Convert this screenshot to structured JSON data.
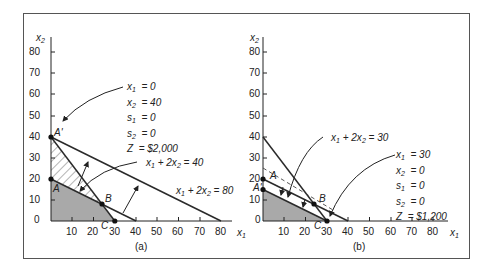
{
  "figure": {
    "panels": [
      {
        "label": "(a)",
        "x_axis_label": "x1",
        "y_axis_label": "x2",
        "x_ticks": [
          "10",
          "20",
          "30",
          "40",
          "50",
          "60",
          "70",
          "80"
        ],
        "y_ticks": [
          "0",
          "10",
          "20",
          "30",
          "40",
          "50",
          "60",
          "70",
          "80"
        ],
        "points": [
          {
            "name": "A'",
            "x": 0,
            "y": 40
          },
          {
            "name": "A",
            "x": 0,
            "y": 20
          },
          {
            "name": "B",
            "x": 24,
            "y": 8
          },
          {
            "name": "C",
            "x": 30,
            "y": 0
          }
        ],
        "line_labels": [
          "x1 + 2x2 = 40",
          "x1 + 2x2 = 80"
        ],
        "callout": {
          "lines": [
            "x1 = 0",
            "x2 = 40",
            "s1 = 0",
            "s2 = 0",
            "Z = $2,000"
          ]
        }
      },
      {
        "label": "(b)",
        "x_axis_label": "x1",
        "y_axis_label": "x2",
        "x_ticks": [
          "10",
          "20",
          "30",
          "40",
          "50",
          "60",
          "70",
          "80"
        ],
        "y_ticks": [
          "0",
          "10",
          "20",
          "30",
          "40",
          "50",
          "60",
          "70",
          "80"
        ],
        "points": [
          {
            "name": "A",
            "x": 0,
            "y": 20
          },
          {
            "name": "A'",
            "x": 0,
            "y": 15
          },
          {
            "name": "B",
            "x": 24,
            "y": 8
          },
          {
            "name": "C",
            "x": 30,
            "y": 0
          }
        ],
        "line_labels": [
          "x1 + 2x2 = 30"
        ],
        "callout": {
          "lines": [
            "x1 = 30",
            "x2 = 0",
            "s1 = 0",
            "s2 = 0",
            "Z = $1,200"
          ]
        }
      }
    ],
    "colors": {
      "line": "#2a2a2a",
      "feasible_fill": "#a9a9a9",
      "frame": "#555555"
    }
  }
}
